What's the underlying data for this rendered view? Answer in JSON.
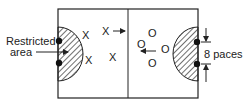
{
  "diagram": {
    "labels": {
      "restricted_line1": "Restricted",
      "restricted_line2": "area",
      "paces": "8 paces"
    },
    "team_x_marks": [
      "X",
      "X",
      "X",
      "X"
    ],
    "team_o_marks": [
      "O",
      "O",
      "O",
      "O"
    ],
    "colors": {
      "line": "#222222",
      "background": "#ffffff"
    }
  }
}
